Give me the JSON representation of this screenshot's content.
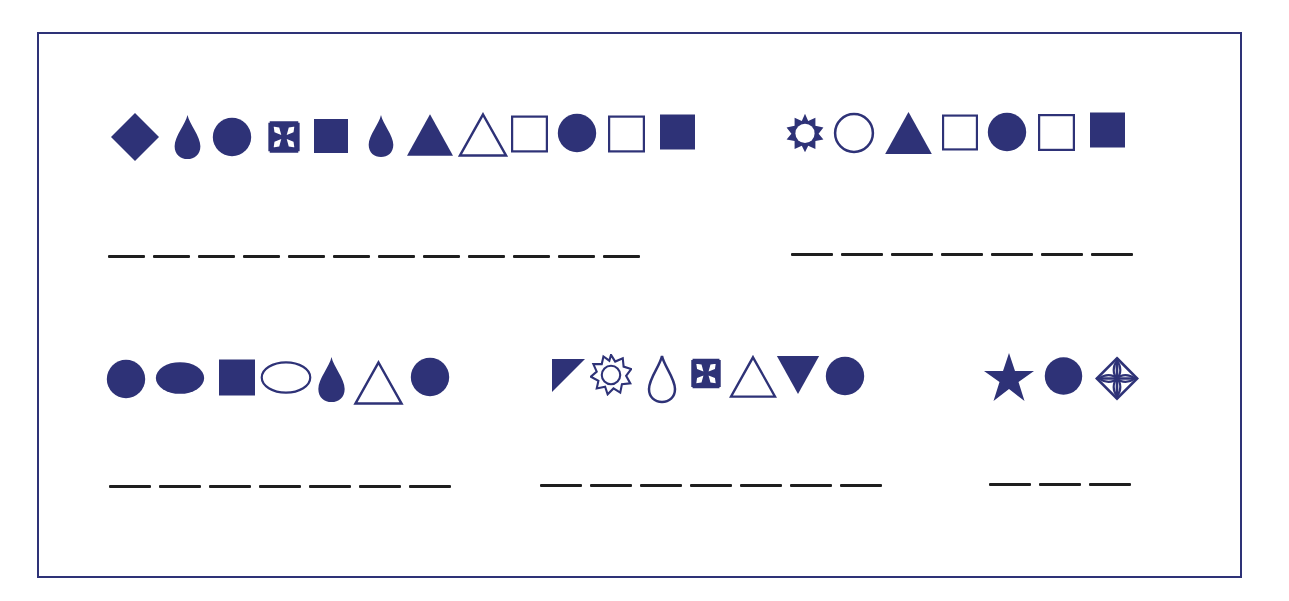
{
  "colors": {
    "shape": "#2e3277",
    "border": "#2e3277",
    "blank_line": "#1e1e1e",
    "background": "#ffffff"
  },
  "puzzles": [
    {
      "id": "row1-left",
      "shapes": [
        "diamond-filled",
        "drop-filled",
        "circle-filled",
        "maltese-cross",
        "square-filled",
        "drop-filled",
        "triangle-filled",
        "triangle-outline",
        "square-outline",
        "circle-filled",
        "square-outline",
        "square-filled"
      ],
      "blank_count": 12
    },
    {
      "id": "row1-right",
      "shapes": [
        "sun-outline",
        "circle-outline",
        "triangle-filled",
        "square-outline",
        "circle-filled",
        "square-outline",
        "square-filled"
      ],
      "blank_count": 7
    },
    {
      "id": "row2-left",
      "shapes": [
        "circle-filled",
        "ellipse-filled",
        "square-filled",
        "ellipse-outline",
        "drop-filled",
        "triangle-outline",
        "circle-filled"
      ],
      "blank_count": 7
    },
    {
      "id": "row2-middle",
      "shapes": [
        "right-triangle-filled",
        "star-nine-outline",
        "drop-outline",
        "maltese-cross",
        "triangle-outline",
        "triangle-down-filled",
        "circle-filled"
      ],
      "blank_count": 7
    },
    {
      "id": "row2-right",
      "shapes": [
        "star-filled",
        "circle-filled",
        "ornamental-diamond-cross"
      ],
      "blank_count": 3
    }
  ]
}
